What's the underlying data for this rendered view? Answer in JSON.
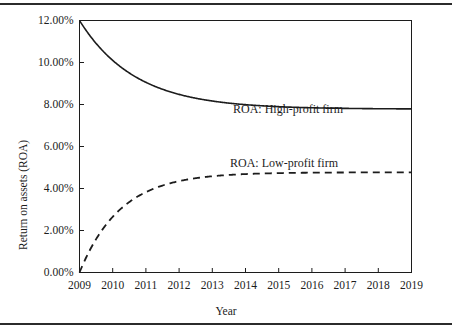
{
  "figure": {
    "width": 452,
    "height": 335,
    "background": "#ffffff",
    "rule_color": "#2b2b2b"
  },
  "chart_data": {
    "type": "line",
    "title": "",
    "xlabel": "Year",
    "ylabel": "Return on assets (ROA)",
    "xlim": [
      2009,
      2019
    ],
    "ylim": [
      0,
      12
    ],
    "grid": false,
    "legend_position": "inline-annotations",
    "x_tick_labels": [
      "2009",
      "2010",
      "2011",
      "2012",
      "2013",
      "2014",
      "2015",
      "2016",
      "2017",
      "2018",
      "2019"
    ],
    "y_tick_labels": [
      "0.00%",
      "2.00%",
      "4.00%",
      "6.00%",
      "8.00%",
      "10.00%",
      "12.00%"
    ],
    "y_tick_values": [
      0,
      2,
      4,
      6,
      8,
      10,
      12
    ],
    "x": [
      2009,
      2010,
      2011,
      2012,
      2013,
      2014,
      2015,
      2016,
      2017,
      2018,
      2019
    ],
    "series": [
      {
        "name": "ROA: High-profit firm",
        "style": "solid",
        "color": "#1c1c1c",
        "values": [
          12.0,
          10.1,
          9.05,
          8.47,
          8.15,
          7.98,
          7.88,
          7.83,
          7.8,
          7.79,
          7.78
        ],
        "asymptote": 7.78
      },
      {
        "name": "ROA: Low-profit firm",
        "style": "dashed",
        "color": "#1c1c1c",
        "values": [
          0.0,
          2.65,
          3.83,
          4.35,
          4.58,
          4.68,
          4.73,
          4.75,
          4.76,
          4.77,
          4.77
        ],
        "asymptote": 4.77
      }
    ],
    "annotations": [
      {
        "text": "ROA: High-profit firm",
        "x": 2016.0,
        "y": 8.6
      },
      {
        "text": "ROA: Low-profit firm",
        "x": 2015.8,
        "y": 6.1
      }
    ]
  }
}
